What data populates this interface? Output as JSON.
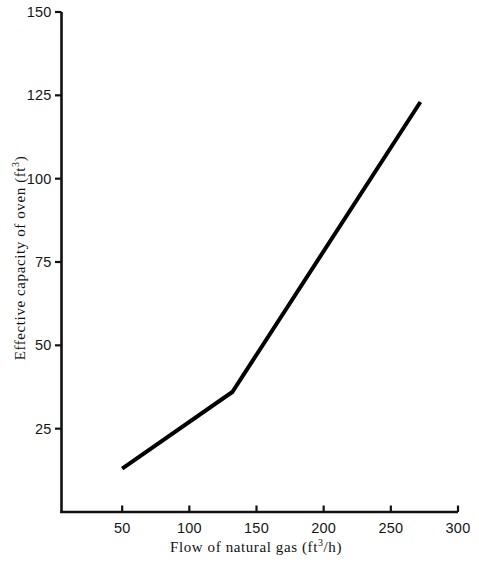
{
  "chart_data": {
    "type": "line",
    "title": "",
    "xlabel": "Flow of natural gas (ft³/h)",
    "ylabel": "Effective capacity of oven (ft³)",
    "xlabel_parts": {
      "text_before": "Flow of natural gas (ft",
      "sup": "3",
      "text_after": "/h)"
    },
    "ylabel_parts": {
      "text_before": "Effective capacity of oven (ft",
      "sup": "3",
      "text_after": ")"
    },
    "xlim": [
      0,
      300
    ],
    "ylim": [
      0,
      150
    ],
    "xticks": [
      50,
      100,
      150,
      200,
      250,
      300
    ],
    "yticks": [
      25,
      50,
      75,
      100,
      125,
      150
    ],
    "xtick_labels": [
      "50",
      "100",
      "150",
      "200",
      "250",
      "300"
    ],
    "ytick_labels": [
      "25",
      "50",
      "75",
      "100",
      "125",
      "150"
    ],
    "grid": false,
    "legend": null,
    "series": [
      {
        "name": "Effective capacity vs gas flow",
        "color": "#000000",
        "line_width": 4,
        "x": [
          50,
          132,
          272
        ],
        "y": [
          13,
          36,
          123
        ]
      }
    ],
    "annotations": []
  },
  "style": {
    "background": "#ffffff",
    "axis_color": "#111111",
    "line_color": "#000000",
    "text_color": "#161616"
  }
}
